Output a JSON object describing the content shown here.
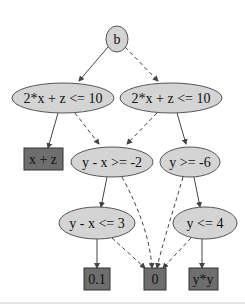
{
  "diagram": {
    "type": "binary decision diagram",
    "colors": {
      "decision_fill": "#d4d4d4",
      "leaf_fill": "#6e6e6e",
      "stroke": "#444444",
      "background": "#ffffff"
    },
    "nodes": {
      "root": {
        "label": "b",
        "shape": "ellipse"
      },
      "l1": {
        "label": "2*x + z <= 10",
        "shape": "ellipse"
      },
      "r1": {
        "label": "2*x + z <= 10",
        "shape": "ellipse"
      },
      "leaf_xz": {
        "label": "x + z",
        "shape": "box"
      },
      "m2": {
        "label": "y - x >= -2",
        "shape": "ellipse"
      },
      "r2": {
        "label": "y >= -6",
        "shape": "ellipse"
      },
      "m3": {
        "label": "y - x <= 3",
        "shape": "ellipse"
      },
      "r3": {
        "label": "y <= 4",
        "shape": "ellipse"
      },
      "leaf_01": {
        "label": "0.1",
        "shape": "box"
      },
      "leaf_0": {
        "label": "0",
        "shape": "box"
      },
      "leaf_yy": {
        "label": "y*y",
        "shape": "box"
      }
    },
    "edges": [
      {
        "from": "root",
        "to": "l1",
        "style": "solid"
      },
      {
        "from": "root",
        "to": "r1",
        "style": "dashed"
      },
      {
        "from": "l1",
        "to": "leaf_xz",
        "style": "solid"
      },
      {
        "from": "l1",
        "to": "m2",
        "style": "dashed"
      },
      {
        "from": "r1",
        "to": "m2",
        "style": "dashed"
      },
      {
        "from": "r1",
        "to": "r2",
        "style": "solid"
      },
      {
        "from": "m2",
        "to": "m3",
        "style": "solid"
      },
      {
        "from": "m2",
        "to": "leaf_0",
        "style": "dashed"
      },
      {
        "from": "r2",
        "to": "leaf_0",
        "style": "dashed"
      },
      {
        "from": "r2",
        "to": "r3",
        "style": "solid"
      },
      {
        "from": "m3",
        "to": "leaf_01",
        "style": "solid"
      },
      {
        "from": "m3",
        "to": "leaf_0",
        "style": "dashed"
      },
      {
        "from": "r3",
        "to": "leaf_0",
        "style": "dashed"
      },
      {
        "from": "r3",
        "to": "leaf_yy",
        "style": "solid"
      }
    ]
  }
}
